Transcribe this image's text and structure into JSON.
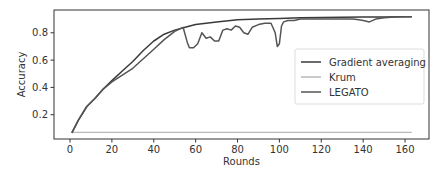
{
  "chart_data": {
    "type": "line",
    "title": "",
    "xlabel": "Rounds",
    "ylabel": "Accuracy",
    "xlim": [
      -8,
      168
    ],
    "ylim": [
      0.0,
      0.96
    ],
    "xticks": [
      0,
      20,
      40,
      60,
      80,
      100,
      120,
      140,
      160
    ],
    "yticks": [
      0.2,
      0.4,
      0.6,
      0.8
    ],
    "xtick_labels": [
      "0",
      "20",
      "40",
      "60",
      "80",
      "100",
      "120",
      "140",
      "160"
    ],
    "ytick_labels": [
      "0.2",
      "0.4",
      "0.6",
      "0.8"
    ],
    "grid": false,
    "legend_position": "center right",
    "series": [
      {
        "name": "Gradient averaging",
        "color": "#3a3a3a",
        "x": [
          1,
          4,
          8,
          12,
          16,
          20,
          25,
          30,
          35,
          40,
          45,
          50,
          55,
          60,
          70,
          80,
          90,
          100,
          110,
          120,
          130,
          140,
          150,
          160,
          163
        ],
        "y": [
          0.07,
          0.16,
          0.26,
          0.32,
          0.39,
          0.45,
          0.52,
          0.59,
          0.67,
          0.74,
          0.79,
          0.82,
          0.84,
          0.86,
          0.88,
          0.895,
          0.9,
          0.905,
          0.91,
          0.912,
          0.914,
          0.915,
          0.916,
          0.917,
          0.918
        ]
      },
      {
        "name": "Krum",
        "color": "#b8b8b8",
        "x": [
          1,
          163
        ],
        "y": [
          0.07,
          0.07
        ]
      },
      {
        "name": "LEGATO",
        "color": "#555555",
        "x": [
          1,
          4,
          8,
          12,
          16,
          20,
          25,
          30,
          35,
          40,
          45,
          50,
          54,
          56,
          57,
          59,
          61,
          63,
          65,
          67,
          69,
          71,
          73,
          75,
          77,
          79,
          81,
          83,
          85,
          87,
          90,
          93,
          96,
          98,
          99,
          100,
          101,
          102,
          104,
          107,
          110,
          115,
          120,
          125,
          130,
          135,
          138,
          140,
          143,
          146,
          150,
          155,
          160,
          163
        ],
        "y": [
          0.07,
          0.16,
          0.26,
          0.32,
          0.39,
          0.44,
          0.49,
          0.54,
          0.61,
          0.68,
          0.75,
          0.81,
          0.84,
          0.73,
          0.69,
          0.69,
          0.72,
          0.8,
          0.76,
          0.77,
          0.74,
          0.74,
          0.82,
          0.83,
          0.82,
          0.85,
          0.84,
          0.8,
          0.79,
          0.84,
          0.86,
          0.87,
          0.87,
          0.8,
          0.7,
          0.72,
          0.85,
          0.88,
          0.89,
          0.89,
          0.9,
          0.9,
          0.9,
          0.9,
          0.9,
          0.9,
          0.895,
          0.89,
          0.88,
          0.9,
          0.91,
          0.915,
          0.918,
          0.918
        ]
      }
    ]
  }
}
